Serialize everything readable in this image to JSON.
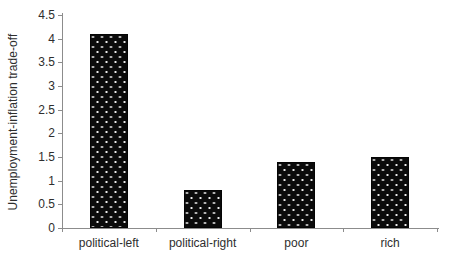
{
  "chart_data": {
    "type": "bar",
    "title": "",
    "xlabel": "",
    "ylabel": "Unemployment-inflation trade-off",
    "categories": [
      "political-left",
      "political-right",
      "poor",
      "rich"
    ],
    "values": [
      4.1,
      0.8,
      1.4,
      1.5
    ],
    "ylim": [
      0,
      4.5
    ],
    "y_ticks": [
      {
        "value": 0,
        "label": "0"
      },
      {
        "value": 0.5,
        "label": "0.5"
      },
      {
        "value": 1,
        "label": "1"
      },
      {
        "value": 1.5,
        "label": "1.5"
      },
      {
        "value": 2,
        "label": "2"
      },
      {
        "value": 2.5,
        "label": "2.5"
      },
      {
        "value": 3,
        "label": "3"
      },
      {
        "value": 3.5,
        "label": "3.5"
      },
      {
        "value": 4,
        "label": "4"
      },
      {
        "value": 4.5,
        "label": "4.5"
      }
    ],
    "grid": false,
    "legend": "none",
    "bar_pattern": "black-with-white-dots",
    "colors": {
      "bar_fill": "#0b0b0b",
      "bar_dot": "#ffffff",
      "axis": "#8c8c8c",
      "text": "#2e2e2e",
      "background": "#ffffff"
    }
  }
}
